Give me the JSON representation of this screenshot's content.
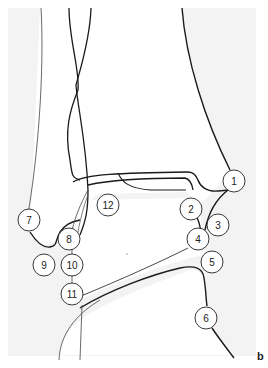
{
  "figure": {
    "panel_letter": "b",
    "background_color": "#f3f3f3",
    "bone_fill": "#ffffff",
    "line_color": "#1a1a1a",
    "labels": [
      {
        "id": "1",
        "text": "1",
        "cx": 234,
        "cy": 181
      },
      {
        "id": "2",
        "text": "2",
        "cx": 191,
        "cy": 209
      },
      {
        "id": "3",
        "text": "3",
        "cx": 218,
        "cy": 225
      },
      {
        "id": "4",
        "text": "4",
        "cx": 198,
        "cy": 239
      },
      {
        "id": "5",
        "text": "5",
        "cx": 212,
        "cy": 262
      },
      {
        "id": "6",
        "text": "6",
        "cx": 206,
        "cy": 318
      },
      {
        "id": "7",
        "text": "7",
        "cx": 29,
        "cy": 220
      },
      {
        "id": "8",
        "text": "8",
        "cx": 69,
        "cy": 239
      },
      {
        "id": "9",
        "text": "9",
        "cx": 44,
        "cy": 265
      },
      {
        "id": "10",
        "text": "10",
        "cx": 72,
        "cy": 265
      },
      {
        "id": "11",
        "text": "11",
        "cx": 72,
        "cy": 294
      },
      {
        "id": "12",
        "text": "12",
        "cx": 108,
        "cy": 205
      }
    ]
  }
}
